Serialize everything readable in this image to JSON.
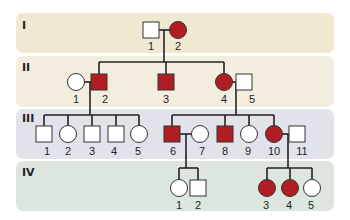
{
  "diagram": {
    "type": "pedigree",
    "colors": {
      "affected": "#B01E23",
      "unaffected": "#ffffff",
      "band_I": "#EFE9D2",
      "band_II": "#F3EDE0",
      "band_III": "#E2E2EA",
      "band_IV": "#DCE6DF"
    },
    "generations": [
      {
        "label": "I",
        "individuals": [
          {
            "id": "1",
            "sex": "male",
            "affected": false
          },
          {
            "id": "2",
            "sex": "female",
            "affected": true
          }
        ]
      },
      {
        "label": "II",
        "individuals": [
          {
            "id": "1",
            "sex": "female",
            "affected": false
          },
          {
            "id": "2",
            "sex": "male",
            "affected": true
          },
          {
            "id": "3",
            "sex": "male",
            "affected": true
          },
          {
            "id": "4",
            "sex": "female",
            "affected": true
          },
          {
            "id": "5",
            "sex": "male",
            "affected": false
          }
        ]
      },
      {
        "label": "III",
        "individuals": [
          {
            "id": "1",
            "sex": "male",
            "affected": false
          },
          {
            "id": "2",
            "sex": "female",
            "affected": false
          },
          {
            "id": "3",
            "sex": "male",
            "affected": false
          },
          {
            "id": "4",
            "sex": "male",
            "affected": false
          },
          {
            "id": "5",
            "sex": "female",
            "affected": false
          },
          {
            "id": "6",
            "sex": "male",
            "affected": true
          },
          {
            "id": "7",
            "sex": "female",
            "affected": false
          },
          {
            "id": "8",
            "sex": "male",
            "affected": true
          },
          {
            "id": "9",
            "sex": "female",
            "affected": false
          },
          {
            "id": "10",
            "sex": "female",
            "affected": true
          },
          {
            "id": "11",
            "sex": "male",
            "affected": false
          }
        ]
      },
      {
        "label": "IV",
        "individuals": [
          {
            "id": "1",
            "sex": "female",
            "affected": false
          },
          {
            "id": "2",
            "sex": "male",
            "affected": false
          },
          {
            "id": "3",
            "sex": "female",
            "affected": true
          },
          {
            "id": "4",
            "sex": "female",
            "affected": true
          },
          {
            "id": "5",
            "sex": "female",
            "affected": false
          }
        ]
      }
    ],
    "matings": [
      {
        "partners": [
          "I-1",
          "I-2"
        ],
        "children": [
          "II-2",
          "II-3",
          "II-4"
        ]
      },
      {
        "partners": [
          "II-1",
          "II-2"
        ],
        "children": [
          "III-1",
          "III-2",
          "III-3",
          "III-4",
          "III-5"
        ]
      },
      {
        "partners": [
          "II-4",
          "II-5"
        ],
        "children": [
          "III-6",
          "III-8",
          "III-9",
          "III-10"
        ]
      },
      {
        "partners": [
          "III-6",
          "III-7"
        ],
        "children": [
          "IV-1",
          "IV-2"
        ]
      },
      {
        "partners": [
          "III-10",
          "III-11"
        ],
        "children": [
          "IV-3",
          "IV-4",
          "IV-5"
        ]
      }
    ]
  }
}
